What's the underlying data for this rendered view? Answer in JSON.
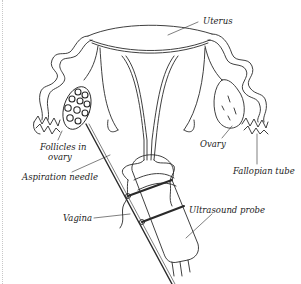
{
  "diagram": {
    "line_color": "#2a2a2a",
    "background": "#ffffff",
    "labels": {
      "uterus": "Uterus",
      "follicles_line1": "Follicles in",
      "follicles_line2": "ovary",
      "ovary": "Ovary",
      "fallopian_tube": "Fallopian tube",
      "aspiration_needle": "Aspiration needle",
      "vagina": "Vagina",
      "ultrasound_probe": "Ultrasound probe"
    }
  }
}
